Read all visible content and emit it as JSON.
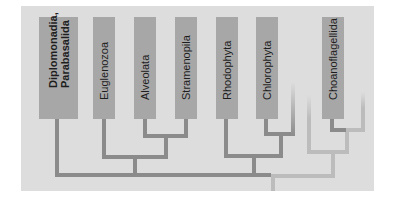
{
  "diagram": {
    "type": "phylogenetic-tree",
    "colors": {
      "panel_background": "#dddddd",
      "taxon_box": "#a7a7a7",
      "branch_dark": "#8b8b8b",
      "branch_light": "#bcbcbc",
      "text": "#1e1e1e"
    },
    "taxa": [
      {
        "label_line1": "Diplomonadia,",
        "label_line2": "Parabasalida",
        "emphasized": true
      },
      {
        "label": "Euglenozoa"
      },
      {
        "label": "Alveolata"
      },
      {
        "label": "Stramenopila"
      },
      {
        "label": "Rhodophyta"
      },
      {
        "label": "Chlorophyta"
      },
      {
        "label": "Choanoflagellida"
      }
    ],
    "topology": "((Diplomonadia/Parabasalida, (Euglenozoa, (Alveolata, Stramenopila))), (Rhodophyta, (Chlorophyta, unlabeled)), ((unlabeled), (Choanoflagellida, unlabeled)))"
  }
}
